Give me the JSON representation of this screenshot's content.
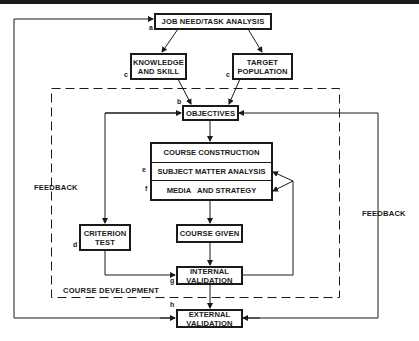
{
  "diagram": {
    "nodes": {
      "job_need": {
        "label": "JOB NEED/TASK ANALYSIS",
        "marker": "a"
      },
      "knowledge": {
        "line1": "KNOWLEDGE",
        "line2": "AND SKILL",
        "marker": "c"
      },
      "target": {
        "line1": "TARGET",
        "line2": "POPULATION",
        "marker": "c"
      },
      "objectives": {
        "label": "OBJECTIVES",
        "marker": "b"
      },
      "course_construction": {
        "rows": [
          "COURSE CONSTRUCTION",
          "SUBJECT MATTER ANALYSIS",
          "MEDIA   AND STRATEGY"
        ],
        "markers": [
          "",
          "e",
          "f"
        ]
      },
      "criterion": {
        "line1": "CRITERION",
        "line2": "TEST",
        "marker": "d"
      },
      "course_given": {
        "label": "COURSE GIVEN"
      },
      "internal": {
        "line1": "INTERNAL",
        "line2": "VALIDATION",
        "marker": "g"
      },
      "external": {
        "line1": "EXTERNAL",
        "line2": "VALIDATION",
        "marker": "h"
      }
    },
    "labels": {
      "feedback_left": "FEEDBACK",
      "feedback_right": "FEEDBACK",
      "course_development": "COURSE DEVELOPMENT"
    },
    "colors": {
      "ink": "#1a1a1a",
      "background": "#ffffff"
    }
  }
}
